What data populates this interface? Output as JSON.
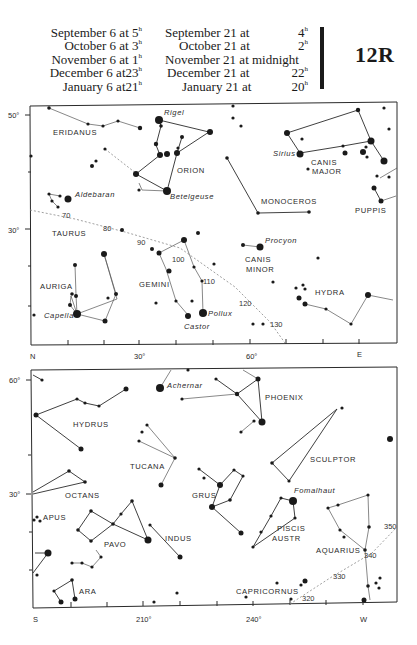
{
  "header": {
    "left_schedule": [
      {
        "date": "September 6 at",
        "hour": "5",
        "unit": "h"
      },
      {
        "date": "October 6 at",
        "hour": "3",
        "unit": "h"
      },
      {
        "date": "November 6 at",
        "hour": "1",
        "unit": "h"
      },
      {
        "date": "December 6 at",
        "hour": "23",
        "unit": "h"
      },
      {
        "date": "January 6 at",
        "hour": "21",
        "unit": "h"
      }
    ],
    "right_schedule": [
      {
        "date": "September 21 at",
        "hour": "4",
        "unit": "h"
      },
      {
        "date": "October 21 at",
        "hour": "2",
        "unit": "h"
      },
      {
        "date": "November 21 at midnight",
        "hour": "",
        "unit": ""
      },
      {
        "date": "December 21 at",
        "hour": "22",
        "unit": "h"
      },
      {
        "date": "January 21 at",
        "hour": "20",
        "unit": "h"
      }
    ],
    "chart_code": "12R"
  },
  "north_chart": {
    "y_axis": {
      "top": "50°",
      "mid": "30°"
    },
    "x_axis": {
      "left": "N",
      "t1": "30°",
      "t2": "60°",
      "right": "E"
    },
    "constellations": [
      "ERIDANUS",
      "ORION",
      "TAURUS",
      "AURIGA",
      "GEMINI",
      "CANIS",
      "MINOR",
      "CANIS",
      "MAJOR",
      "MONOCEROS",
      "PUPPIS",
      "HYDRA"
    ],
    "stars": [
      "Rigel",
      "Betelgeuse",
      "Aldebaran",
      "Capella",
      "Castor",
      "Pollux",
      "Procyon",
      "Sirius"
    ],
    "ecliptic_marks": [
      "70",
      "80",
      "90",
      "100",
      "110",
      "120",
      "130"
    ]
  },
  "south_chart": {
    "y_axis": {
      "top": "60°",
      "mid": "30°"
    },
    "x_axis": {
      "left": "S",
      "t1": "210°",
      "t2": "240°",
      "right": "W"
    },
    "constellations": [
      "HYDRUS",
      "PHOENIX",
      "TUCANA",
      "SCULPTOR",
      "OCTANS",
      "GRUS",
      "APUS",
      "PAVO",
      "INDUS",
      "PISCIS",
      "AUSTR",
      "AQUARIUS",
      "ARA",
      "CAPRICORNUS"
    ],
    "stars": [
      "Achernar",
      "Fomalhaut"
    ],
    "ecliptic_marks": [
      "320",
      "330",
      "340",
      "350"
    ]
  }
}
